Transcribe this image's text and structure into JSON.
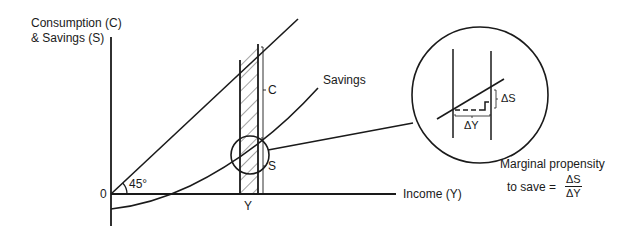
{
  "diagram": {
    "type": "economics-graph",
    "y_axis_label_line1": "Consumption (C)",
    "y_axis_label_line2": "& Savings (S)",
    "x_axis_label": "Income (Y)",
    "origin_label": "0",
    "angle_label": "45°",
    "curve_label": "Savings",
    "consumption_label": "C",
    "savings_label": "S",
    "income_tick_label": "Y",
    "inset": {
      "delta_s_label": "ΔS",
      "delta_y_label": "ΔY"
    },
    "formula": {
      "line1": "Marginal propensity",
      "line2_prefix": "to save =",
      "numerator": "ΔS",
      "denominator": "ΔY"
    },
    "colors": {
      "ink": "#1a1a1a",
      "background": "#ffffff"
    }
  }
}
